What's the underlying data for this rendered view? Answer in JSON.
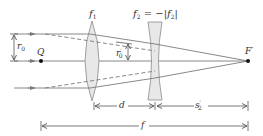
{
  "diagram": {
    "type": "optical-ray-diagram",
    "colors": {
      "line": "#6b6b6b",
      "ray": "#7a7a7a",
      "lens_fill": "#e6e6e6",
      "lens_stroke": "#8a8a8a",
      "text": "#333333",
      "point": "#111111"
    },
    "labels": {
      "f1": {
        "base": "f",
        "sub": "1"
      },
      "f2_eq": {
        "lhs_base": "f",
        "lhs_sub": "2",
        "eq": " = −|",
        "rhs_base": "f",
        "rhs_sub": "2",
        "close": "|"
      },
      "r0": {
        "base": "r",
        "sub": "0"
      },
      "r0_prime": {
        "base": "r",
        "sup": "′",
        "sub": "0"
      },
      "Q": "Q",
      "F_prime": "F′",
      "d": "d",
      "s2_prime": {
        "base": "s",
        "sup": "′",
        "sub": "2"
      },
      "f": "f"
    },
    "elements": {
      "lens1": {
        "kind": "converging",
        "label": "f1"
      },
      "lens2": {
        "kind": "diverging",
        "label": "f2 = −|f2|"
      },
      "points": [
        "Q",
        "F′"
      ],
      "dimensions": [
        "r0",
        "r0′",
        "d",
        "s2′",
        "f"
      ]
    }
  }
}
